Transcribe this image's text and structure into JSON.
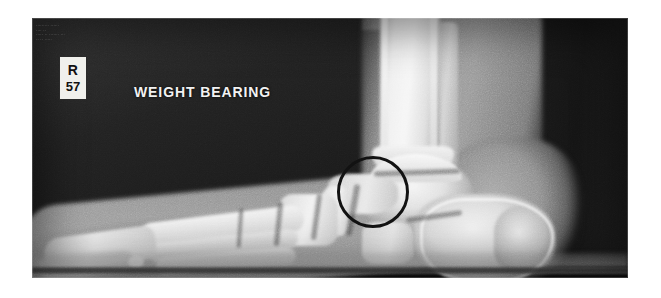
{
  "image": {
    "modality": "x-ray-radiograph",
    "body_part": "foot-ankle-lateral",
    "view": "lateral weight-bearing",
    "frame": {
      "x": 32,
      "y": 18,
      "width": 596,
      "height": 260
    },
    "background_color": "#ffffff",
    "film_dark_color": "#1b1b1b",
    "bone_bright_color": "#f2f2f2"
  },
  "annotations": {
    "weight_bearing_label": "WEIGHT BEARING",
    "side_marker": {
      "side": "R",
      "number": "57",
      "box_color": "#f0f0ec",
      "text_color": "#111111"
    },
    "circle": {
      "name": "region-of-interest-circle",
      "color": "#141414",
      "center_x": 373,
      "center_y": 192,
      "radius": 36,
      "stroke_width": 3.5
    },
    "header_overlay_text": "......... ......\n.... ..\n..... .. ....... ...\n.. .. .....",
    "header_overlay_legible": false
  },
  "anatomy_labels": {
    "tibia": "tibia",
    "fibula": "fibula",
    "talus": "talus",
    "calcaneus": "calcaneus",
    "navicular": "navicular",
    "cuboid": "cuboid",
    "cuneiforms": "cuneiforms",
    "metatarsals": "metatarsals",
    "phalanges": "phalanges",
    "floor_plate": "weight-bearing platform"
  }
}
